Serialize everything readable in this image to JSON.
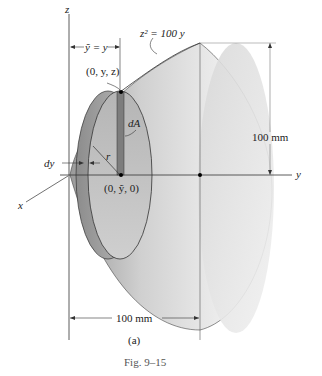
{
  "figure": {
    "caption": "Fig. 9–15",
    "subfigure_label": "(a)"
  },
  "axes": {
    "x_label": "x",
    "y_label": "y",
    "z_label": "z"
  },
  "annotations": {
    "curve_equation": "z² = 100 y",
    "ybar_eq": "ỹ = y",
    "point_top": "(0, y, z)",
    "point_center": "(0, ỹ, 0)",
    "area_element": "dA",
    "radius": "r",
    "thickness": "dy",
    "height_dim": "100 mm",
    "length_dim": "100 mm"
  },
  "colors": {
    "surface_light": "#f2f2f2",
    "surface_mid": "#cfcfcf",
    "surface_dark": "#8a8a8a",
    "strip": "#7a7a7a",
    "line": "#333333"
  }
}
